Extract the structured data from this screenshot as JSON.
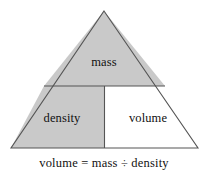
{
  "figure": {
    "type": "formula-triangle",
    "title_text": "",
    "background_color": "#ffffff",
    "stroke_color": "#555555",
    "shaded_fill_color": "#c9c9c9",
    "unshaded_fill_color": "#ffffff",
    "text_color": "#111111"
  },
  "diagram": {
    "apex": {
      "x": 104,
      "y": 11
    },
    "bottom_left": {
      "x": 11,
      "y": 148
    },
    "bottom_right": {
      "x": 198,
      "y": 148
    },
    "horizontal_divider": {
      "x1": 44,
      "y1": 86,
      "x2": 165,
      "y2": 86
    },
    "vertical_divider": {
      "x1": 104.5,
      "y1": 86,
      "x2": 104.5,
      "y2": 148
    },
    "regions": [
      {
        "name": "mass",
        "label": "mass",
        "shaded": true,
        "position": "top"
      },
      {
        "name": "density",
        "label": "density",
        "shaded": true,
        "position": "bottom-left"
      },
      {
        "name": "volume",
        "label": "volume",
        "shaded": false,
        "position": "bottom-right"
      }
    ]
  },
  "caption": {
    "formula": "volume = mass ÷ density",
    "result": "volume",
    "equals": "=",
    "numerator": "mass",
    "divide": "÷",
    "denominator": "density"
  }
}
